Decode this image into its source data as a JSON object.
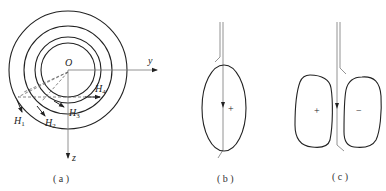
{
  "panels": [
    {
      "id": "a",
      "caption": "( a )",
      "origin_label": "O",
      "y_axis_label": "y",
      "z_axis_label": "z",
      "field_labels": [
        {
          "name": "H",
          "sub": "1"
        },
        {
          "name": "H",
          "sub": "2"
        },
        {
          "name": "H",
          "sub": "3"
        },
        {
          "name": "H",
          "sub": "4"
        }
      ],
      "description": "Four concentric circles around origin O with dashed lines from O and tangent field vectors H1–H4"
    },
    {
      "id": "b",
      "caption": "( b )",
      "sign": "+",
      "description": "Single elliptical loop with vertical double-line conductor and downward arrow"
    },
    {
      "id": "c",
      "caption": "( c )",
      "left_sign": "+",
      "right_sign": "−",
      "description": "Two symmetric lobes separated by a vertical conductor with downward arrow"
    }
  ],
  "colors": {
    "stroke": "#222222",
    "dashed": "#666666",
    "thin_line": "#777777",
    "background": "#ffffff"
  }
}
